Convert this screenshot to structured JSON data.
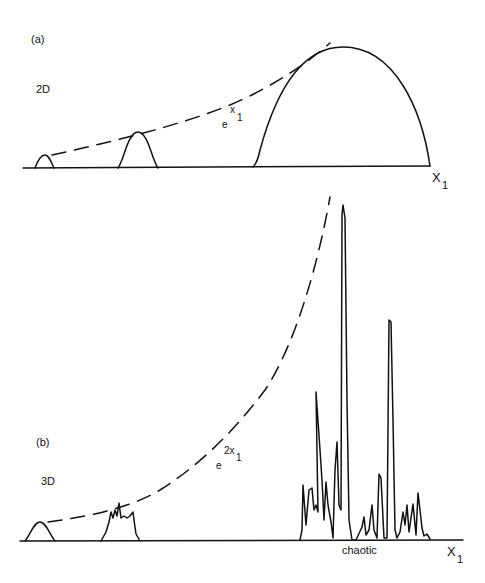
{
  "panel_a": {
    "tag": "(a)",
    "dimension": "2D",
    "envelope_base": "e",
    "envelope_exp": "x",
    "envelope_sub": "1",
    "axis_label": "X",
    "axis_sub": "1"
  },
  "panel_b": {
    "tag": "(b)",
    "dimension": "3D",
    "envelope_base": "e",
    "envelope_exp": "2x",
    "envelope_sub": "1",
    "axis_label": "X",
    "axis_sub": "1",
    "annotation": "chaotic"
  },
  "colors": {
    "ink": "#111111",
    "background": "#ffffff"
  }
}
